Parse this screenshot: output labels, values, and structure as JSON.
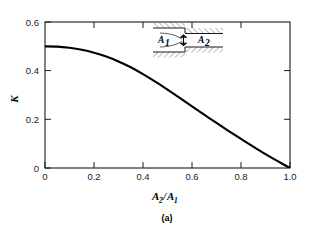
{
  "chart_data": {
    "type": "line",
    "title": "",
    "subtitle": "",
    "xlabel": "A2/A1",
    "ylabel": "K",
    "xlim": [
      0,
      1.0
    ],
    "ylim": [
      0,
      0.6
    ],
    "grid": false,
    "legend": null,
    "x_ticks": [
      "0",
      "0.2",
      "0.4",
      "0.6",
      "0.8",
      "1.0"
    ],
    "x_tick_values": [
      0,
      0.2,
      0.4,
      0.6,
      0.8,
      1.0
    ],
    "y_ticks": [
      "0",
      "0.2",
      "0.4",
      "0.6"
    ],
    "y_tick_values": [
      0,
      0.2,
      0.4,
      0.6
    ],
    "series": [
      {
        "name": "Sudden contraction loss coefficient",
        "x": [
          0.0,
          0.05,
          0.1,
          0.15,
          0.2,
          0.25,
          0.3,
          0.35,
          0.4,
          0.45,
          0.5,
          0.55,
          0.6,
          0.65,
          0.7,
          0.75,
          0.8,
          0.85,
          0.9,
          0.95,
          1.0
        ],
        "values": [
          0.5,
          0.499,
          0.494,
          0.486,
          0.474,
          0.458,
          0.438,
          0.414,
          0.386,
          0.355,
          0.322,
          0.288,
          0.253,
          0.219,
          0.185,
          0.152,
          0.12,
          0.088,
          0.057,
          0.028,
          0.0
        ]
      }
    ],
    "annotations": [
      {
        "name": "inset-diagram",
        "type": "schematic",
        "description": "sudden contraction duct"
      },
      {
        "name": "inset-label-a1",
        "text": "A1"
      },
      {
        "name": "inset-label-a2",
        "text": "A2"
      }
    ]
  },
  "axes": {
    "y_label_main": "K",
    "x_label_num": "A",
    "x_label_num_sub": "2",
    "x_label_slash": "/",
    "x_label_den": "A",
    "x_label_den_sub": "1",
    "y_tick_0": "0",
    "y_tick_1": "0.2",
    "y_tick_2": "0.4",
    "y_tick_3": "0.6",
    "x_tick_0": "0",
    "x_tick_1": "0.2",
    "x_tick_2": "0.4",
    "x_tick_3": "0.6",
    "x_tick_4": "0.8",
    "x_tick_5": "1.0"
  },
  "inset": {
    "label_a1": "A",
    "label_a1_sub": "1",
    "label_a2": "A",
    "label_a2_sub": "2"
  },
  "caption": {
    "text": "(a)"
  },
  "colors": {
    "curve": "#000000",
    "axis": "#1a1a1a",
    "background": "#ffffff",
    "text": "#000000"
  }
}
